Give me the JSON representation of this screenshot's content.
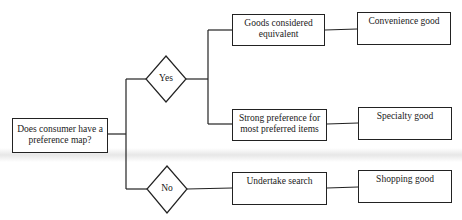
{
  "diagram": {
    "start": {
      "label": "Does consumer have a preference map?"
    },
    "decisions": {
      "yes": {
        "label": "Yes"
      },
      "no": {
        "label": "No"
      }
    },
    "branches": {
      "goods_equivalent": {
        "label": "Goods considered equivalent"
      },
      "strong_preference": {
        "label": "Strong preference for most preferred items"
      },
      "undertake_search": {
        "label": "Undertake search"
      }
    },
    "outcomes": {
      "convenience": {
        "label": "Convenience good"
      },
      "specialty": {
        "label": "Specialty good"
      },
      "shopping": {
        "label": "Shopping good"
      }
    },
    "colors": {
      "line": "#222222",
      "background": "#ffffff"
    }
  }
}
